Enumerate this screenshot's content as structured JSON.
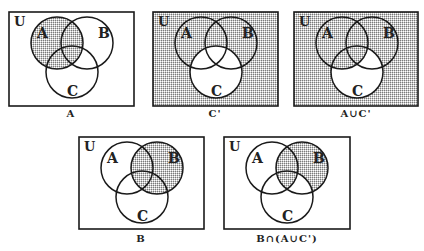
{
  "colors": {
    "stroke": "#1a1a1a",
    "shade_dot": "#8a8a8a",
    "background": "#ffffff"
  },
  "labels": {
    "universe": "U",
    "set_a": "A",
    "set_b": "B",
    "set_c": "C"
  },
  "diagrams": [
    {
      "id": "d1",
      "caption": "A",
      "x": 9,
      "y": 12,
      "w": 125,
      "h": 94,
      "shaded_regions": [
        "A only",
        "A∩B only",
        "A∩C only",
        "A∩B∩C"
      ]
    },
    {
      "id": "d2",
      "caption": "C'",
      "x": 153,
      "y": 12,
      "w": 125,
      "h": 94,
      "shaded_regions": [
        "outside all",
        "A only",
        "B only",
        "A∩B only"
      ]
    },
    {
      "id": "d3",
      "caption": "A∪C'",
      "x": 294,
      "y": 12,
      "w": 124,
      "h": 94,
      "shaded_regions": [
        "outside all",
        "A only",
        "B only",
        "A∩B only",
        "A∩C only",
        "A∩B∩C"
      ]
    },
    {
      "id": "d4",
      "caption": "B",
      "x": 79,
      "y": 137,
      "w": 125,
      "h": 92,
      "shaded_regions": [
        "B only",
        "A∩B only",
        "B∩C only",
        "A∩B∩C"
      ]
    },
    {
      "id": "d5",
      "caption": "B∩(A∪C')",
      "x": 224,
      "y": 137,
      "w": 126,
      "h": 92,
      "shaded_regions": [
        "B only",
        "A∩B only",
        "A∩B∩C"
      ]
    }
  ]
}
